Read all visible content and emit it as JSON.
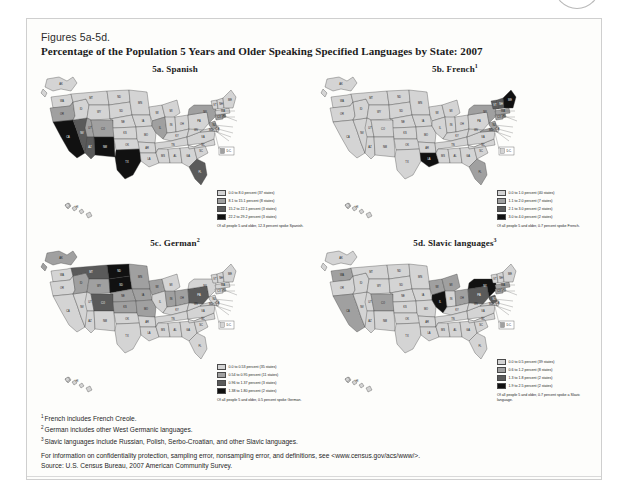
{
  "header": {
    "figure_number": "Figures 5a-5d.",
    "title": "Percentage of the Population 5 Years and Older Speaking Specified Languages by State: 2007"
  },
  "footnotes": [
    {
      "marker": "1",
      "text": "French includes French Creole."
    },
    {
      "marker": "2",
      "text": "German includes other West Germanic languages."
    },
    {
      "marker": "3",
      "text": "Slavic languages include Russian, Polish, Serbo-Croatian, and other Slavic languages."
    }
  ],
  "info_line": "For information on confidentiality protection, sampling error, nonsampling error, and definitions, see <www.census.gov/acs/www/>.",
  "source_line": "Source: U.S. Census Bureau, 2007 American Community Survey.",
  "dc_callout": "D.C.",
  "palette": {
    "c1": "#d4d4d4",
    "c2": "#a0a0a0",
    "c3": "#5a5a5a",
    "c4": "#111111",
    "outline": "#3a3a3a"
  },
  "chart_data": [
    {
      "type": "heatmap",
      "id": "5a",
      "title": "5a. Spanish",
      "title_superscript": "",
      "subject": "Spanish",
      "note": "Of all people 5 and older, 12.3 percent spoke Spanish.",
      "national_percent": 12.3,
      "legend": [
        {
          "label": "0.0 to 8.0 percent (37 states)",
          "min": 0.0,
          "max": 8.0,
          "states": 37,
          "color": "#d4d4d4"
        },
        {
          "label": "8.1 to 15.1 percent (8 states)",
          "min": 8.1,
          "max": 15.1,
          "states": 8,
          "color": "#a0a0a0"
        },
        {
          "label": "15.2 to 22.1 percent (3 states)",
          "min": 15.2,
          "max": 22.1,
          "states": 3,
          "color": "#5a5a5a"
        },
        {
          "label": "22.2 to 29.2 percent (3 states)",
          "min": 22.2,
          "max": 29.2,
          "states": 3,
          "color": "#111111"
        }
      ],
      "state_classes": {
        "CA": 4,
        "TX": 4,
        "NM": 4,
        "AZ": 3,
        "NV": 3,
        "FL": 3,
        "CO": 2,
        "NY": 2,
        "NJ": 2,
        "IL": 2,
        "RI": 2,
        "CT": 2,
        "OR": 2,
        "UT": 2,
        "ID": 1,
        "WA": 1,
        "MT": 1,
        "WY": 1,
        "ND": 1,
        "SD": 1,
        "NE": 1,
        "KS": 1,
        "OK": 1,
        "MN": 1,
        "IA": 1,
        "MO": 1,
        "AR": 1,
        "LA": 1,
        "WI": 1,
        "MI": 1,
        "IN": 1,
        "OH": 1,
        "KY": 1,
        "TN": 1,
        "MS": 1,
        "AL": 1,
        "GA": 1,
        "SC": 1,
        "NC": 1,
        "VA": 1,
        "WV": 1,
        "PA": 1,
        "MD": 1,
        "DE": 1,
        "MA": 1,
        "VT": 1,
        "NH": 1,
        "ME": 1,
        "AK": 1,
        "HI": 1,
        "DC": 2
      }
    },
    {
      "type": "heatmap",
      "id": "5b",
      "title": "5b. French",
      "title_superscript": "1",
      "subject": "French",
      "note": "Of all people 5 and older, 0.7 percent spoke French.",
      "national_percent": 0.7,
      "legend": [
        {
          "label": "0.0 to 1.0 percent (40 states)",
          "min": 0.0,
          "max": 1.0,
          "states": 40,
          "color": "#d4d4d4"
        },
        {
          "label": "1.1 to 2.0 percent (7 states)",
          "min": 1.1,
          "max": 2.0,
          "states": 7,
          "color": "#a0a0a0"
        },
        {
          "label": "2.1 to 3.0 percent (2 states)",
          "min": 2.1,
          "max": 3.0,
          "states": 2,
          "color": "#5a5a5a"
        },
        {
          "label": "3.0 to 4.0 percent (2 states)",
          "min": 3.0,
          "max": 4.0,
          "states": 2,
          "color": "#111111"
        }
      ],
      "state_classes": {
        "ME": 4,
        "LA": 4,
        "NH": 3,
        "VT": 3,
        "RI": 2,
        "MA": 2,
        "CT": 2,
        "NY": 2,
        "FL": 2,
        "MD": 2,
        "NJ": 2,
        "WA": 1,
        "OR": 1,
        "CA": 1,
        "NV": 1,
        "ID": 1,
        "MT": 1,
        "WY": 1,
        "UT": 1,
        "AZ": 1,
        "CO": 1,
        "NM": 1,
        "ND": 1,
        "SD": 1,
        "NE": 1,
        "KS": 1,
        "OK": 1,
        "TX": 1,
        "MN": 1,
        "IA": 1,
        "MO": 1,
        "AR": 1,
        "WI": 1,
        "IL": 1,
        "MI": 1,
        "IN": 1,
        "OH": 1,
        "KY": 1,
        "TN": 1,
        "MS": 1,
        "AL": 1,
        "GA": 1,
        "SC": 1,
        "NC": 1,
        "VA": 1,
        "WV": 1,
        "PA": 1,
        "DE": 1,
        "AK": 1,
        "HI": 1,
        "DC": 1
      }
    },
    {
      "type": "heatmap",
      "id": "5c",
      "title": "5c. German",
      "title_superscript": "2",
      "subject": "German",
      "note": "Of all people 5 and older, 0.5 percent spoke German.",
      "national_percent": 0.5,
      "legend": [
        {
          "label": "0.0 to 0.53 percent (35 states)",
          "min": 0.0,
          "max": 0.53,
          "states": 35,
          "color": "#d4d4d4"
        },
        {
          "label": "0.54 to 0.95 percent (11 states)",
          "min": 0.54,
          "max": 0.95,
          "states": 11,
          "color": "#a0a0a0"
        },
        {
          "label": "0.96 to 1.37 percent (3 states)",
          "min": 0.96,
          "max": 1.37,
          "states": 3,
          "color": "#5a5a5a"
        },
        {
          "label": "1.38 to 1.80 percent (2 states)",
          "min": 1.38,
          "max": 1.8,
          "states": 2,
          "color": "#111111"
        }
      ],
      "state_classes": {
        "ND": 4,
        "SD": 4,
        "PA": 3,
        "CO": 3,
        "MT": 3,
        "ID": 2,
        "WY": 2,
        "MN": 2,
        "WI": 2,
        "IA": 2,
        "NE": 2,
        "KS": 2,
        "AK": 2,
        "MO": 2,
        "OH": 2,
        "IN": 2,
        "WA": 1,
        "OR": 1,
        "CA": 1,
        "NV": 1,
        "UT": 1,
        "AZ": 1,
        "NM": 1,
        "TX": 1,
        "OK": 1,
        "AR": 1,
        "LA": 1,
        "MS": 1,
        "AL": 1,
        "TN": 1,
        "KY": 1,
        "IL": 1,
        "MI": 1,
        "GA": 1,
        "FL": 1,
        "SC": 1,
        "NC": 1,
        "VA": 1,
        "WV": 1,
        "MD": 1,
        "DE": 1,
        "NJ": 1,
        "NY": 1,
        "CT": 1,
        "RI": 1,
        "MA": 1,
        "VT": 1,
        "NH": 1,
        "ME": 1,
        "HI": 1,
        "DC": 1
      }
    },
    {
      "type": "heatmap",
      "id": "5d",
      "title": "5d. Slavic languages",
      "title_superscript": "3",
      "subject": "Slavic languages",
      "note": "Of all people 5 and older, 0.7 percent spoke a Slavic language.",
      "national_percent": 0.7,
      "legend": [
        {
          "label": "0.0 to 0.5 percent (39 states)",
          "min": 0.0,
          "max": 0.5,
          "states": 39,
          "color": "#d4d4d4"
        },
        {
          "label": "0.6 to 1.2 percent (8 states)",
          "min": 0.6,
          "max": 1.2,
          "states": 8,
          "color": "#a0a0a0"
        },
        {
          "label": "1.3 to 1.8 percent (2 states)",
          "min": 1.3,
          "max": 1.8,
          "states": 2,
          "color": "#5a5a5a"
        },
        {
          "label": "1.9 to 2.5 percent (2 states)",
          "min": 1.9,
          "max": 2.5,
          "states": 2,
          "color": "#111111"
        }
      ],
      "state_classes": {
        "NY": 4,
        "IL": 4,
        "NJ": 3,
        "PA": 3,
        "CT": 2,
        "MA": 2,
        "OH": 2,
        "MI": 2,
        "WI": 2,
        "CO": 2,
        "WA": 2,
        "CA": 2,
        "OR": 1,
        "NV": 1,
        "ID": 1,
        "MT": 1,
        "WY": 1,
        "UT": 1,
        "AZ": 1,
        "NM": 1,
        "ND": 1,
        "SD": 1,
        "NE": 1,
        "KS": 1,
        "OK": 1,
        "TX": 1,
        "MN": 1,
        "IA": 1,
        "MO": 1,
        "AR": 1,
        "LA": 1,
        "IN": 1,
        "KY": 1,
        "TN": 1,
        "MS": 1,
        "AL": 1,
        "GA": 1,
        "FL": 1,
        "SC": 1,
        "NC": 1,
        "VA": 1,
        "WV": 1,
        "MD": 1,
        "DE": 1,
        "RI": 1,
        "VT": 1,
        "NH": 1,
        "ME": 1,
        "AK": 1,
        "HI": 1,
        "DC": 2
      }
    }
  ]
}
